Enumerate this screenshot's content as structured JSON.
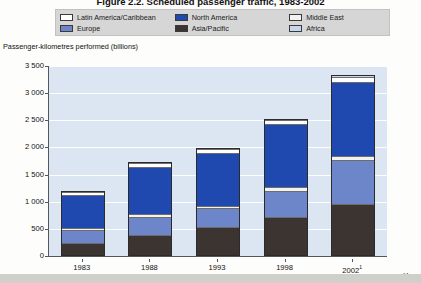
{
  "figure": {
    "figure_number": "Figure 2.2.",
    "title": "Scheduled passenger traffic, 1983-2002",
    "full_title": "Figure 2.2. Scheduled passenger traffic, 1983-2002"
  },
  "legend": {
    "items": [
      {
        "label": "Latin America/Caribbean",
        "color": "#ffffff"
      },
      {
        "label": "North America",
        "color": "#1f49ae"
      },
      {
        "label": "Middle East",
        "color": "#f2f2f0"
      },
      {
        "label": "Europe",
        "color": "#6d85c9"
      },
      {
        "label": "Asia/Pacific",
        "color": "#3b3430"
      },
      {
        "label": "Africa",
        "color": "#c6d6ec"
      }
    ]
  },
  "axes": {
    "y_title": "Passenger-kilometres performed (billions)",
    "y_ticks": [
      "0",
      "500",
      "1 000",
      "1 500",
      "2 000",
      "2 500",
      "3 000",
      "3 500"
    ],
    "y_min": 0,
    "y_max": 3500,
    "x_title": "Year",
    "x_ticks": [
      "1983",
      "1988",
      "1993",
      "1998",
      "2002"
    ],
    "x_last_footnote": "1"
  },
  "chart_data": {
    "type": "bar",
    "stacked": true,
    "title": "Figure 2.2. Scheduled passenger traffic, 1983-2002",
    "xlabel": "Year",
    "ylabel": "Passenger-kilometres performed (billions)",
    "ylim": [
      0,
      3500
    ],
    "ytick_step": 500,
    "grid": true,
    "legend_position": "top",
    "categories": [
      "1983",
      "1988",
      "1993",
      "1998",
      "2002"
    ],
    "series": [
      {
        "name": "Asia/Pacific",
        "color": "#3b3430",
        "values": [
          215,
          360,
          505,
          690,
          935
        ]
      },
      {
        "name": "Europe",
        "color": "#6d85c9",
        "values": [
          455,
          690,
          855,
          1175,
          1745
        ]
      },
      {
        "name": "Middle East",
        "color": "#f2f2f0",
        "values": [
          500,
          745,
          910,
          1245,
          1830
        ]
      },
      {
        "name": "North America",
        "color": "#1f49ae",
        "values": [
          1120,
          1640,
          1900,
          2430,
          3210
        ]
      },
      {
        "name": "Latin America/Caribbean",
        "color": "#ffffff",
        "values": [
          1180,
          1710,
          1965,
          2505,
          3300
        ]
      },
      {
        "name": "Africa",
        "color": "#c6d6ec",
        "values": [
          1200,
          1730,
          1990,
          2530,
          3330
        ]
      }
    ],
    "segment_values": {
      "note": "per-region contribution (cumulative tops listed in series.values)",
      "1983": {
        "Asia/Pacific": 215,
        "Europe": 240,
        "Middle East": 45,
        "North America": 620,
        "Latin America/Caribbean": 60,
        "Africa": 20
      },
      "1988": {
        "Asia/Pacific": 360,
        "Europe": 330,
        "Middle East": 55,
        "North America": 895,
        "Latin America/Caribbean": 70,
        "Africa": 20
      },
      "1993": {
        "Asia/Pacific": 505,
        "Europe": 350,
        "Middle East": 55,
        "North America": 990,
        "Latin America/Caribbean": 65,
        "Africa": 25
      },
      "1998": {
        "Asia/Pacific": 690,
        "Europe": 485,
        "Middle East": 70,
        "North America": 1185,
        "Latin America/Caribbean": 75,
        "Africa": 25
      },
      "2002": {
        "Asia/Pacific": 935,
        "Europe": 810,
        "Middle East": 85,
        "North America": 1380,
        "Latin America/Caribbean": 90,
        "Africa": 30
      }
    },
    "totals": [
      1200,
      1730,
      1990,
      2530,
      3330
    ]
  }
}
